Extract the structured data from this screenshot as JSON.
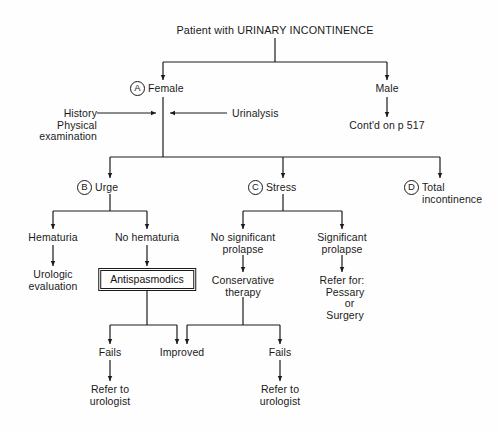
{
  "diagram": {
    "title": "Patient with URINARY INCONTINENCE",
    "type": "clinical-algorithm-flowchart",
    "stroke_color": "#1a1a1a",
    "background_color": "#fefefe"
  },
  "tags": {
    "a": "A",
    "b": "B",
    "c": "C",
    "d": "D"
  },
  "nodes": {
    "root": "Patient with URINARY INCONTINENCE",
    "female": "Female",
    "male": "Male",
    "history": "History\nPhysical\n  examination",
    "urinalysis": "Urinalysis",
    "contd": "Cont'd on p 517",
    "urge": "Urge",
    "stress": "Stress",
    "total": "Total\nincontinence",
    "hematuria": "Hematuria",
    "urologic_eval": "Urologic\nevaluation",
    "no_hematuria": "No hematuria",
    "antispasmodics": "Antispasmodics",
    "no_sig_prolapse": "No significant\nprolapse",
    "sig_prolapse": "Significant\nprolapse",
    "conservative": "Conservative\ntherapy",
    "refer_for": "Refer for:\n  Pessary\n     or\n  Surgery",
    "fails_left": "Fails",
    "improved": "Improved",
    "fails_right": "Fails",
    "refer_urologist_left": "Refer to\nurologist",
    "refer_urologist_right": "Refer to\nurologist"
  }
}
